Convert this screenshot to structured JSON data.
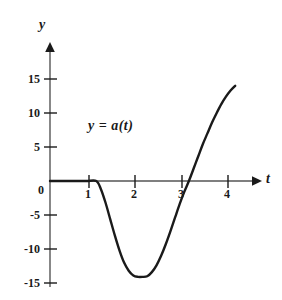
{
  "figure": {
    "background_color": "#ffffff",
    "ink_color": "#1a1a1a",
    "axis_color": "#555555"
  },
  "labels": {
    "y_axis": "y",
    "x_axis": "t",
    "curve": "y = a(t)",
    "origin": "0"
  },
  "chart_data": {
    "type": "line",
    "title": "",
    "subtitle": "",
    "xlabel": "t",
    "ylabel": "y",
    "annotations": [
      "y = a(t)"
    ],
    "legend": [],
    "legend_position": "none",
    "grid": false,
    "xlim": [
      0,
      4.3
    ],
    "ylim": [
      -15,
      16
    ],
    "xticks": [
      1,
      2,
      3,
      4
    ],
    "xtick_labels": [
      "1",
      "2",
      "3",
      "4"
    ],
    "yticks": [
      -15,
      -10,
      -5,
      5,
      10,
      15
    ],
    "ytick_labels": [
      "-15",
      "-10",
      "-5",
      "5",
      "10",
      "15"
    ],
    "origin_label": "0",
    "zero_crossings": [
      1,
      3
    ],
    "minimum": {
      "x": 2.1,
      "y": -14
    },
    "endpoint": {
      "x": 4,
      "y": 14
    },
    "series": [
      {
        "name": "a(t)",
        "x": [
          0.0,
          0.2,
          0.4,
          0.6,
          0.8,
          1.0,
          1.1,
          1.2,
          1.3,
          1.4,
          1.5,
          1.6,
          1.7,
          1.8,
          1.9,
          2.0,
          2.1,
          2.2,
          2.3,
          2.4,
          2.5,
          2.6,
          2.7,
          2.8,
          2.9,
          3.0,
          3.1,
          3.2,
          3.3,
          3.4,
          3.5,
          3.6,
          3.7,
          3.8,
          3.9,
          4.0
        ],
        "y": [
          0,
          0,
          0,
          0,
          0,
          0,
          -1.2,
          -3.2,
          -5.6,
          -8.0,
          -10.2,
          -12.0,
          -13.2,
          -13.9,
          -14.1,
          -14.1,
          -14.0,
          -13.4,
          -12.4,
          -11.0,
          -9.3,
          -7.4,
          -5.4,
          -3.4,
          -1.6,
          0.0,
          1.8,
          3.6,
          5.4,
          7.0,
          8.6,
          10.0,
          11.3,
          12.4,
          13.3,
          14.0
        ]
      }
    ]
  }
}
